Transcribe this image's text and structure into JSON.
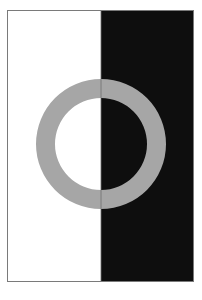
{
  "artwork": {
    "description": "Half white / half black panel with a gray ring centered over the dividing line",
    "frame": {
      "x": 7.5,
      "y": 10.5,
      "width": 186,
      "height": 271
    },
    "divider_x": 101,
    "ring": {
      "cx": 101,
      "cy": 144,
      "outer_radius": 65,
      "inner_radius": 46
    },
    "colors": {
      "left_panel": "#ffffff",
      "right_panel": "#0e0e0e",
      "ring": "#a6a6a6",
      "frame_border": "#7a7a7a",
      "divider_line": "#6e6e6e",
      "page_background": "#ffffff"
    }
  }
}
